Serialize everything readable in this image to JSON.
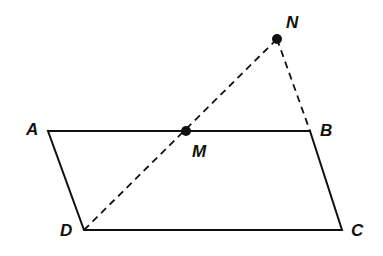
{
  "diagram": {
    "type": "geometry",
    "points": {
      "A": {
        "label": "A",
        "x": 48,
        "y": 131
      },
      "B": {
        "label": "B",
        "x": 310,
        "y": 131
      },
      "C": {
        "label": "C",
        "x": 342,
        "y": 230
      },
      "D": {
        "label": "D",
        "x": 84,
        "y": 230
      },
      "M": {
        "label": "M",
        "x": 186,
        "y": 131
      },
      "N": {
        "label": "N",
        "x": 277,
        "y": 39
      }
    },
    "solid_segments": [
      [
        "A",
        "B"
      ],
      [
        "B",
        "C"
      ],
      [
        "C",
        "D"
      ],
      [
        "D",
        "A"
      ]
    ],
    "dashed_segments": [
      [
        "D",
        "N"
      ],
      [
        "N",
        "B"
      ]
    ],
    "marked_points": [
      "M",
      "N"
    ],
    "colors": {
      "stroke": "#111111",
      "background": "#ffffff"
    }
  }
}
